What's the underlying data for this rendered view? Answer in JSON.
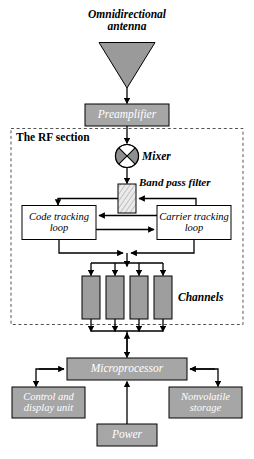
{
  "diagram": {
    "section_label": "The RF section",
    "blocks": {
      "antenna": {
        "label": "Omnidirectional\nantenna",
        "shape": "triangle-down",
        "fill": "#9a9a9a"
      },
      "preamplifier": {
        "label": "Preamplifier",
        "fill": "#a6a6a6"
      },
      "mixer": {
        "label": "Mixer",
        "shape": "circle-quadrant",
        "fill": "#8f8f8f"
      },
      "band_pass_filter": {
        "label": "Band pass filter",
        "shape": "small-rect-hatched",
        "fill": "#e8e8e8"
      },
      "code_tracking_loop": {
        "label": "Code tracking\nloop",
        "fill": "#ffffff"
      },
      "carrier_tracking_loop": {
        "label": "Carrier tracking\nloop",
        "fill": "#ffffff"
      },
      "channels": {
        "label": "Channels",
        "count": 4,
        "fill": "#9e9e9e"
      },
      "microprocessor": {
        "label": "Microprocessor",
        "fill": "#a6a6a6"
      },
      "control_display_unit": {
        "label": "Control and\ndisplay unit",
        "fill": "#a6a6a6"
      },
      "nonvolatile_storage": {
        "label": "Nonvolatile\nstorage",
        "fill": "#a6a6a6"
      },
      "power": {
        "label": "Power",
        "fill": "#a6a6a6"
      }
    },
    "colors": {
      "fill_gray": "#a6a6a6",
      "stroke": "#000000",
      "dashed_boundary": "#555555",
      "background": "#ffffff",
      "text_light": "#ffffff",
      "text_dark": "#000000"
    },
    "connections": [
      {
        "from": "antenna",
        "to": "preamplifier"
      },
      {
        "from": "preamplifier",
        "to": "mixer"
      },
      {
        "from": "mixer",
        "to": "band_pass_filter"
      },
      {
        "from": "band_pass_filter",
        "to": "code_tracking_loop"
      },
      {
        "from": "carrier_tracking_loop",
        "to": "band_pass_filter"
      },
      {
        "from": "carrier_tracking_loop",
        "to": "code_tracking_loop"
      },
      {
        "from": "code_tracking_loop",
        "to": "carrier_tracking_loop"
      },
      {
        "from": "tracking_loops",
        "to": "channels"
      },
      {
        "from": "channels",
        "to": "microprocessor"
      },
      {
        "from": "microprocessor",
        "to": "control_display_unit"
      },
      {
        "from": "microprocessor",
        "to": "nonvolatile_storage"
      },
      {
        "from": "power",
        "to": "microprocessor"
      }
    ]
  }
}
